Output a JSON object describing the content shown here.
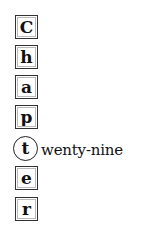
{
  "heading": {
    "letters": [
      "C",
      "h",
      "a",
      "p",
      "t",
      "e",
      "r"
    ],
    "highlighted_letter": "t",
    "highlighted_suffix": "wenty-nine",
    "full_text": "Chapter twenty-nine"
  }
}
